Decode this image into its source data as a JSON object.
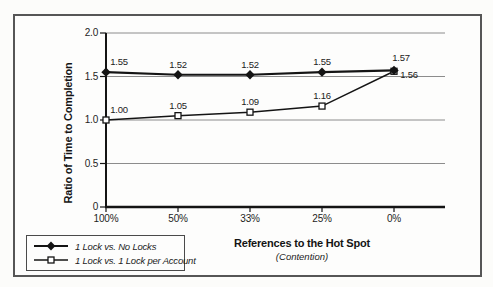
{
  "figure": {
    "background": "#fcfcfa",
    "frame_color": "#565656"
  },
  "chart_data": {
    "type": "line",
    "title": "",
    "categories": [
      "100%",
      "50%",
      "33%",
      "25%",
      "0%"
    ],
    "series": [
      {
        "name": "1 Lock vs. No Locks",
        "marker": "filled-diamond",
        "values": [
          1.55,
          1.52,
          1.52,
          1.55,
          1.57
        ],
        "labels": [
          "1.55",
          "1.52",
          "1.52",
          "1.55",
          "1.57"
        ],
        "label_offsets": [
          [
            13,
            -10
          ],
          [
            0,
            -10
          ],
          [
            0,
            -10
          ],
          [
            0,
            -10
          ],
          [
            7,
            -12
          ]
        ]
      },
      {
        "name": "1 Lock vs. 1 Lock per Account",
        "marker": "open-square",
        "values": [
          1.0,
          1.05,
          1.09,
          1.16,
          1.56
        ],
        "labels": [
          "1.00",
          "1.05",
          "1.09",
          "1.16",
          "1.56"
        ],
        "label_offsets": [
          [
            13,
            -10
          ],
          [
            0,
            -10
          ],
          [
            0,
            -10
          ],
          [
            0,
            -10
          ],
          [
            15,
            4
          ]
        ]
      }
    ],
    "xlabel": "References to the Hot Spot",
    "xlabel_sub": "(Contention)",
    "ylabel": "Ratio of Time to Completion",
    "ylim": [
      0,
      2.0
    ],
    "yticks": [
      "2.0",
      "1.5",
      "1.0",
      "0.5",
      "0"
    ],
    "ytick_values": [
      2.0,
      1.5,
      1.0,
      0.5,
      0
    ],
    "grid": true,
    "legend_position": "bottom-left",
    "line_color": "#141414",
    "grid_color": "#8c8c8c"
  }
}
